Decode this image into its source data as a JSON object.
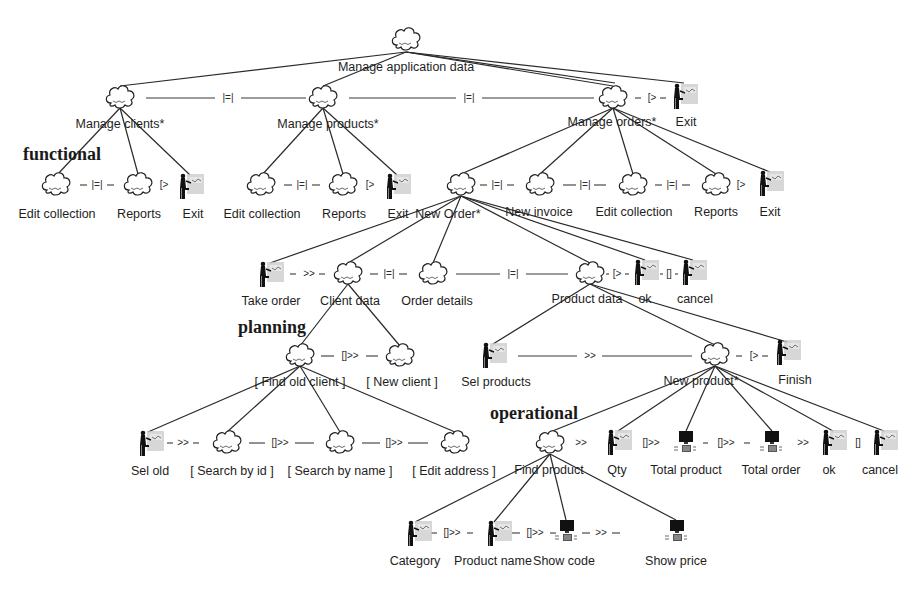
{
  "diagram": {
    "type": "ConcurTaskTrees task model",
    "layers": {
      "functional": "functional",
      "planning": "planning",
      "operational": "operational"
    },
    "icon_types": {
      "abstract": "cloud-icon",
      "interaction": "user-at-desk-icon",
      "application": "computer-icon"
    },
    "nodes": {
      "root": {
        "label": "Manage application data",
        "icon": "abstract"
      },
      "manage_clients": {
        "label": "Manage clients*",
        "icon": "abstract"
      },
      "manage_products": {
        "label": "Manage products*",
        "icon": "abstract"
      },
      "manage_orders": {
        "label": "Manage orders*",
        "icon": "abstract"
      },
      "exit_top": {
        "label": "Exit",
        "icon": "interaction"
      },
      "clients_edit": {
        "label": "Edit collection",
        "icon": "abstract"
      },
      "clients_reports": {
        "label": "Reports",
        "icon": "abstract"
      },
      "clients_exit": {
        "label": "Exit",
        "icon": "interaction"
      },
      "products_edit": {
        "label": "Edit collection",
        "icon": "abstract"
      },
      "products_reports": {
        "label": "Reports",
        "icon": "abstract"
      },
      "products_exit": {
        "label": "Exit",
        "icon": "interaction"
      },
      "new_order": {
        "label": "New Order*",
        "icon": "abstract"
      },
      "new_invoice": {
        "label": "New invoice",
        "icon": "abstract"
      },
      "orders_edit": {
        "label": "Edit collection",
        "icon": "abstract"
      },
      "orders_reports": {
        "label": "Reports",
        "icon": "abstract"
      },
      "orders_exit": {
        "label": "Exit",
        "icon": "interaction"
      },
      "take_order": {
        "label": "Take order",
        "icon": "interaction"
      },
      "client_data": {
        "label": "Client data",
        "icon": "abstract"
      },
      "order_details": {
        "label": "Order details",
        "icon": "abstract"
      },
      "product_data": {
        "label": "Product data",
        "icon": "abstract"
      },
      "ok_order": {
        "label": "ok",
        "icon": "interaction"
      },
      "cancel_order": {
        "label": "cancel",
        "icon": "interaction"
      },
      "find_old_client": {
        "label": "[ Find old client ]",
        "icon": "abstract"
      },
      "new_client": {
        "label": "[ New client ]",
        "icon": "abstract"
      },
      "sel_products": {
        "label": "Sel products",
        "icon": "interaction"
      },
      "new_product": {
        "label": "New product*",
        "icon": "abstract"
      },
      "finish": {
        "label": "Finish",
        "icon": "interaction"
      },
      "sel_old": {
        "label": "Sel old",
        "icon": "interaction"
      },
      "search_by_id": {
        "label": "[ Search by id ]",
        "icon": "abstract"
      },
      "search_by_name": {
        "label": "[ Search by name ]",
        "icon": "abstract"
      },
      "edit_address": {
        "label": "[ Edit address ]",
        "icon": "abstract"
      },
      "find_product": {
        "label": "Find product",
        "icon": "abstract"
      },
      "qty": {
        "label": "Qty",
        "icon": "interaction"
      },
      "total_product": {
        "label": "Total product",
        "icon": "application"
      },
      "total_order": {
        "label": "Total order",
        "icon": "application"
      },
      "ok_product": {
        "label": "ok",
        "icon": "interaction"
      },
      "cancel_product": {
        "label": "cancel",
        "icon": "interaction"
      },
      "category": {
        "label": "Category",
        "icon": "interaction"
      },
      "product_name": {
        "label": "Product name",
        "icon": "interaction"
      },
      "show_code": {
        "label": "Show code",
        "icon": "application"
      },
      "show_price": {
        "label": "Show price",
        "icon": "application"
      }
    },
    "operators": {
      "clients_products": "|=|",
      "products_orders": "|=|",
      "orders_exit": "[>",
      "c_edit_reports": "|=|",
      "c_reports_exit": "[>",
      "p_edit_reports": "|=|",
      "p_reports_exit": "[>",
      "o_neworder_invoice": "|=|",
      "o_invoice_edit": "|=|",
      "o_edit_reports": "|=|",
      "o_reports_exit": "[>",
      "take_client": ">>",
      "client_details": "|=|",
      "details_product": "|=|",
      "product_ok": "[>",
      "ok_cancel": "[]",
      "find_new_client": "[]>>",
      "selproducts_newproduct": ">>",
      "newproduct_finish": "[>",
      "selold_searchid": ">>",
      "searchid_searchname": "[]>>",
      "searchname_editaddress": "[]>>",
      "find_qty": ">>",
      "qty_totalproduct": "[]>>",
      "totalproduct_totalorder": "[]>>",
      "totalorder_ok": ">>",
      "ok_cancel_product": "[]",
      "category_productname": "[]>>",
      "productname_showcode": "[]>>",
      "showcode_showprice": ">>"
    }
  }
}
